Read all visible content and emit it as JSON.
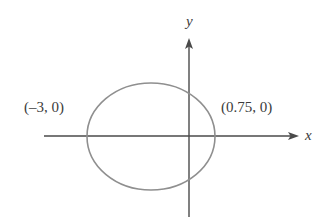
{
  "figure": {
    "background_color": "#ffffff",
    "width": 330,
    "height": 223
  },
  "axes": {
    "x_label": "x",
    "y_label": "y",
    "axis_color": "#4a4a4a",
    "x_axis": {
      "y_pixel": 136,
      "start_x_pixel": 44,
      "end_x_pixel": 299,
      "arrow": "right"
    },
    "y_axis": {
      "x_pixel": 189,
      "start_y_pixel": 38,
      "end_y_pixel": 217,
      "arrow": "up"
    }
  },
  "curve": {
    "type": "ellipse",
    "stroke_color": "#8f8f8f",
    "stroke_width": 1.6,
    "fill": "none",
    "center_pixel": {
      "x": 151,
      "y": 136.5
    },
    "radius_pixel": {
      "rx": 64,
      "ry": 53.5
    }
  },
  "annotations": {
    "left_intercept": "(–3, 0)",
    "right_intercept": "(0.75, 0)"
  },
  "chart_data": {
    "type": "scatter",
    "xlabel": "x",
    "ylabel": "y",
    "grid": false,
    "legend": "none",
    "annotations": [
      {
        "text": "(–3, 0)",
        "x": -3,
        "y": 0
      },
      {
        "text": "(0.75, 0)",
        "x": 0.75,
        "y": 0
      }
    ],
    "series": [
      {
        "name": "ellipse",
        "type": "ellipse",
        "center": [
          -1.125,
          0
        ],
        "rx": 1.875,
        "ry": 1.567,
        "x_intercepts": [
          -3,
          0.75
        ]
      }
    ],
    "xlim": [
      -3.6,
      1.4
    ],
    "ylim": [
      -1.75,
      1.75
    ]
  }
}
